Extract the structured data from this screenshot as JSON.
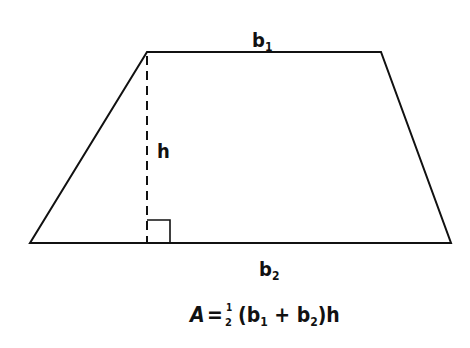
{
  "diagram": {
    "labels": {
      "top_base": {
        "main": "b",
        "sub": "1"
      },
      "bottom_base": {
        "main": "b",
        "sub": "2"
      },
      "height": "h"
    },
    "formula": {
      "lhs": "A",
      "equals": "=",
      "frac_num": "1",
      "frac_den": "2",
      "open": "(b",
      "sub1": "1",
      "plus": " + b",
      "sub2": "2",
      "close": ")h"
    },
    "colors": {
      "stroke": "#111111",
      "background": "#ffffff"
    }
  }
}
